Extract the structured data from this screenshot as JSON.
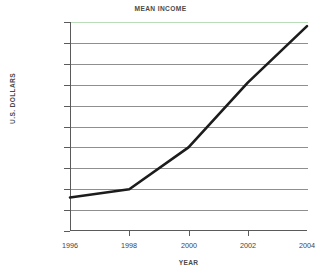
{
  "chart_data": {
    "type": "line",
    "title": "MEAN INCOME",
    "xlabel": "YEAR",
    "ylabel": "U.S. DOLLARS",
    "x": [
      1996,
      1998,
      2000,
      2002,
      2004
    ],
    "values": [
      133000,
      135000,
      145000,
      160500,
      174000
    ],
    "series": [
      {
        "name": "Mean income",
        "values": [
          133000,
          135000,
          145000,
          160500,
          174000
        ]
      }
    ],
    "xlim": [
      1996,
      2004
    ],
    "ylim": [
      125000,
      175000
    ],
    "xticks": [
      "1996",
      "1998",
      "2000",
      "2002",
      "2004"
    ],
    "yticks": [
      "125,000",
      "130,000",
      "135,000",
      "140,000",
      "145,000",
      "150,000",
      "155,000",
      "160,000",
      "165,000",
      "170,000",
      "175,000"
    ],
    "ytick_values": [
      125000,
      130000,
      135000,
      140000,
      145000,
      150000,
      155000,
      160000,
      165000,
      170000,
      175000
    ],
    "grid": true,
    "legend": false,
    "line_color": "#1c1c1c",
    "grid_color": "#8f8f8f",
    "top_gridline_color": "#b9dcb9",
    "axis_color": "#5a5a5a",
    "background": "#ffffff"
  }
}
